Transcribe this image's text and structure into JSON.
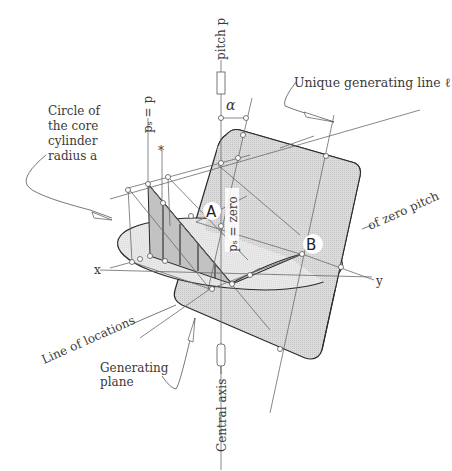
{
  "figure": {
    "labels": {
      "pitch_p": "pitch p",
      "alpha": "α",
      "unique_generating_line": "Unique generating line ℓ",
      "circle_core_line1": "Circle of",
      "circle_core_line2": "the core",
      "circle_core_line3": "cylinder",
      "circle_core_line4": "radius a",
      "ps_equals_p": "pₛ = p",
      "asterisk": "*",
      "point_a": "A",
      "ps_equals_zero": "pₛ = zero",
      "point_b": "B",
      "of_zero_pitch": "of zero pitch",
      "x_axis": "x",
      "y_axis": "y",
      "line_of_locations": "Line of locations",
      "generating_plane_line1": "Generating",
      "generating_plane_line2": "plane",
      "central_axis": "Central axis"
    },
    "colors": {
      "plane_fill": "#d4d4d4",
      "ellipse_fill": "#e6e6e6",
      "strip_fill": "#c8c8c8",
      "line": "#6a6a6a",
      "outline": "#2a2a2a",
      "text": "#3a3a3a"
    }
  }
}
